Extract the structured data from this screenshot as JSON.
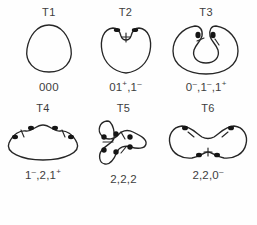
{
  "figure": {
    "background_color": "#fefefe",
    "stroke_color": "#262626",
    "node_color": "#151515",
    "text_color": "#3d3d3d",
    "rows": 2,
    "columns": 3
  },
  "panels": [
    {
      "id": "T1",
      "title": "T1",
      "label": "000",
      "label_parts": [
        {
          "text": "000",
          "sup": ""
        }
      ],
      "shape": "rounded-triangle-oval",
      "node_count": 0,
      "tick_count": 0
    },
    {
      "id": "T2",
      "title": "T2",
      "label": "01+,1-",
      "label_parts": [
        {
          "text": "01",
          "sup": "+"
        },
        {
          "text": ",1",
          "sup": "–"
        }
      ],
      "shape": "heart-with-notch",
      "node_count": 2,
      "tick_count": 1
    },
    {
      "id": "T3",
      "title": "T3",
      "label": "0-,1-,1+",
      "label_parts": [
        {
          "text": "0",
          "sup": "–"
        },
        {
          "text": ",1",
          "sup": "–"
        },
        {
          "text": ",1",
          "sup": "+"
        }
      ],
      "shape": "horseshoe-c-shape",
      "node_count": 2,
      "tick_count": 2
    },
    {
      "id": "T4",
      "title": "T4",
      "label": "1-,2,1+",
      "label_parts": [
        {
          "text": "1",
          "sup": "–"
        },
        {
          "text": ",2,1",
          "sup": "+"
        }
      ],
      "shape": "mound-lens",
      "node_count": 4,
      "tick_count": 2
    },
    {
      "id": "T5",
      "title": "T5",
      "label": "2,2,2",
      "label_parts": [
        {
          "text": "2,2,2",
          "sup": ""
        }
      ],
      "shape": "trefoil-three-lobed",
      "node_count": 6,
      "tick_count": 3
    },
    {
      "id": "T6",
      "title": "T6",
      "label": "2,2,0-",
      "label_parts": [
        {
          "text": "2,2,0",
          "sup": "–"
        }
      ],
      "shape": "peanut-bowtie",
      "node_count": 4,
      "tick_count": 3
    }
  ]
}
